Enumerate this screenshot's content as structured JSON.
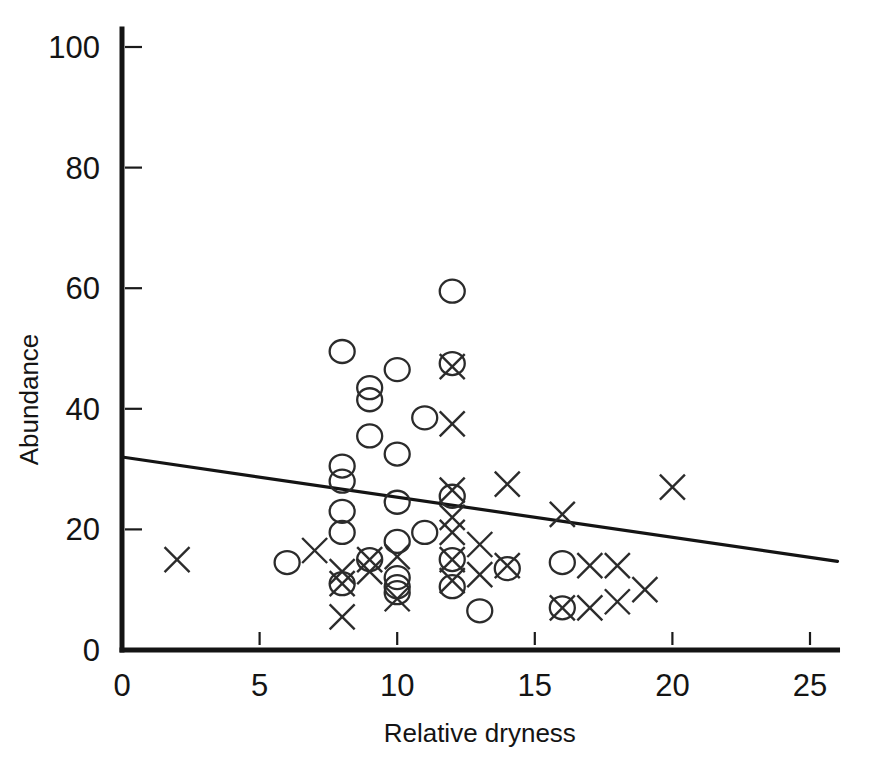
{
  "chart_data": {
    "type": "scatter",
    "title": "",
    "xlabel": "Relative dryness",
    "ylabel": "Abundance",
    "xlim": [
      0,
      26
    ],
    "ylim": [
      0,
      103
    ],
    "xticks": [
      0,
      5,
      10,
      15,
      20,
      25
    ],
    "xtick_labels": [
      "0",
      "5",
      "10",
      "15",
      "20",
      "25"
    ],
    "yticks": [
      0,
      20,
      40,
      60,
      80,
      100
    ],
    "ytick_labels": [
      "0",
      "20",
      "40",
      "60",
      "80",
      "100"
    ],
    "grid": false,
    "legend": "none",
    "series": [
      {
        "name": "open-circle",
        "marker": "circle",
        "points": [
          [
            6,
            14.5
          ],
          [
            8,
            49.5
          ],
          [
            8,
            30.5
          ],
          [
            8,
            28.0
          ],
          [
            8,
            23.0
          ],
          [
            8,
            19.5
          ],
          [
            8,
            11.0
          ],
          [
            9,
            43.5
          ],
          [
            9,
            41.5
          ],
          [
            9,
            35.5
          ],
          [
            9,
            15.0
          ],
          [
            10,
            46.5
          ],
          [
            10,
            32.5
          ],
          [
            10,
            24.5
          ],
          [
            10,
            18.0
          ],
          [
            10,
            12.0
          ],
          [
            10,
            10.5
          ],
          [
            10,
            9.5
          ],
          [
            11,
            38.5
          ],
          [
            11,
            19.5
          ],
          [
            12,
            59.5
          ],
          [
            12,
            47.5
          ],
          [
            12,
            25.5
          ],
          [
            12,
            15.0
          ],
          [
            12,
            10.5
          ],
          [
            13,
            6.5
          ],
          [
            14,
            13.5
          ],
          [
            16,
            14.5
          ],
          [
            16,
            7.0
          ]
        ]
      },
      {
        "name": "cross",
        "marker": "cross",
        "points": [
          [
            2,
            15.0
          ],
          [
            7,
            16.5
          ],
          [
            8,
            13.0
          ],
          [
            8,
            11.0
          ],
          [
            8,
            5.5
          ],
          [
            9,
            15.0
          ],
          [
            9,
            13.0
          ],
          [
            10,
            15.5
          ],
          [
            10,
            8.5
          ],
          [
            12,
            47.0
          ],
          [
            12,
            37.5
          ],
          [
            12,
            26.5
          ],
          [
            12,
            22.0
          ],
          [
            12,
            19.5
          ],
          [
            12,
            15.0
          ],
          [
            12,
            11.5
          ],
          [
            13,
            17.5
          ],
          [
            13,
            12.5
          ],
          [
            14,
            27.5
          ],
          [
            14,
            14.0
          ],
          [
            16,
            22.5
          ],
          [
            16,
            7.0
          ],
          [
            17,
            7.0
          ],
          [
            17,
            14.0
          ],
          [
            18,
            14.0
          ],
          [
            18,
            8.0
          ],
          [
            19,
            10.0
          ],
          [
            20,
            27.0
          ]
        ]
      }
    ],
    "trend_line": {
      "name": "regression-line",
      "x0": 0,
      "y0": 32.0,
      "x1": 26,
      "y1": 14.7
    }
  }
}
